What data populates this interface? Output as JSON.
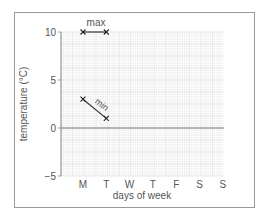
{
  "chart_data": {
    "type": "line",
    "title": "",
    "xlabel": "days of week",
    "ylabel": "temperature (°C)",
    "categories": [
      "M",
      "T",
      "W",
      "T",
      "F",
      "S",
      "S"
    ],
    "ylim": [
      -5,
      10
    ],
    "yticks": [
      -5,
      0,
      5,
      10
    ],
    "grid": true,
    "series": [
      {
        "name": "max",
        "values": [
          10,
          10,
          null,
          null,
          null,
          null,
          null
        ]
      },
      {
        "name": "min",
        "values": [
          3,
          1,
          null,
          null,
          null,
          null,
          null
        ]
      }
    ],
    "annotations": [
      {
        "text": "max",
        "near": "max series, above line"
      },
      {
        "text": "min",
        "near": "min series, rotated along line"
      }
    ]
  },
  "axes": {
    "x_label": "days of week",
    "y_label": "temperature (°C)",
    "y_ticks": [
      "10",
      "5",
      "0",
      "−5"
    ],
    "x_ticks": [
      "M",
      "T",
      "W",
      "T",
      "F",
      "S",
      "S"
    ]
  },
  "labels": {
    "max": "max",
    "min": "min"
  },
  "colors": {
    "grid_minor": "#ececec",
    "grid_major": "#d4d4d4",
    "axis": "#888888",
    "series": "#333333",
    "zero_line": "#777777"
  }
}
